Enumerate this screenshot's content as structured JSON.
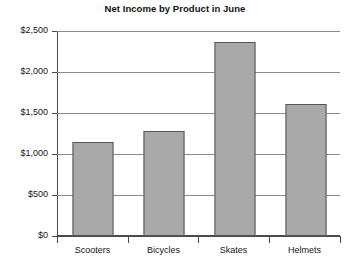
{
  "chart_data": {
    "type": "bar",
    "title": "Net Income by Product in June",
    "xlabel": "",
    "ylabel": "",
    "categories": [
      "Scooters",
      "Bicycles",
      "Skates",
      "Helmets"
    ],
    "values": [
      1150,
      1280,
      2370,
      1610
    ],
    "ylim": [
      0,
      2500
    ],
    "ytick_values": [
      0,
      500,
      1000,
      1500,
      2000,
      2500
    ],
    "ytick_labels": [
      "$0",
      "$500",
      "$1,000",
      "$1,500",
      "$2,000",
      "$2,500"
    ],
    "grid": true,
    "legend": false,
    "legend_position": "none",
    "bar_fill_color": "#a9a9a9",
    "bar_border_color": "#555555",
    "axis_color": "#4a4a4a",
    "gridline_color": "#8c8c8c",
    "background_color": "#ffffff",
    "text_color": "#161616"
  }
}
